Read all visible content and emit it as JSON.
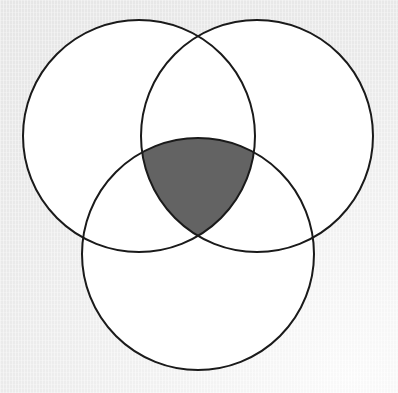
{
  "figure": {
    "type": "venn-diagram"
  },
  "canvas": {
    "width": 398,
    "height": 393,
    "background_color": "#ebebeb",
    "background_color_light": "#fdfdfd"
  },
  "style": {
    "circle_fill": "#ffffff",
    "circle_stroke": "#1a1a1a",
    "circle_stroke_width": 2,
    "shaded_region_fill": "#636363",
    "shaded_region_stroke": "#1a1a1a"
  },
  "chart_data": {
    "type": "venn",
    "set_count": 3,
    "circles": [
      {
        "id": "A",
        "label": "",
        "cx": 139,
        "cy": 136,
        "r": 116,
        "position": "top-left"
      },
      {
        "id": "B",
        "label": "",
        "cx": 257,
        "cy": 136,
        "r": 116,
        "position": "top-right"
      },
      {
        "id": "C",
        "label": "",
        "cx": 198,
        "cy": 254,
        "r": 116,
        "position": "bottom-center"
      }
    ],
    "shaded_regions": [
      {
        "id": "A-and-B-and-C",
        "description": "intersection of all three circles",
        "fill": "#636363",
        "vertices": [
          {
            "x": 143,
            "y": 133
          },
          {
            "x": 257,
            "y": 133
          },
          {
            "x": 199,
            "y": 255
          }
        ]
      }
    ],
    "unshaded_regions": [
      "A only",
      "B only",
      "C only",
      "A and B only",
      "A and C only",
      "B and C only"
    ],
    "title": "",
    "legend": [],
    "annotations": []
  },
  "labels": {
    "set_a": "",
    "set_b": "",
    "set_c": "",
    "intersection": ""
  }
}
